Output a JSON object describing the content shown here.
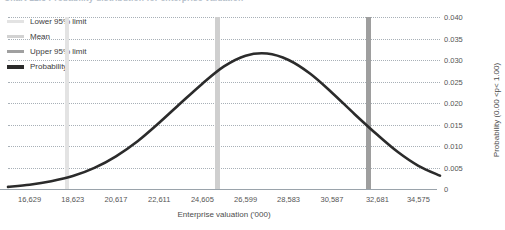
{
  "chart_title": "Chart 12.3  Probability distribution for enterprise valuation",
  "legend": {
    "items": [
      {
        "label": "Lower 95% limit",
        "color": "#e3e3e3",
        "thick": false
      },
      {
        "label": "Mean",
        "color": "#d2d2d2",
        "thick": false
      },
      {
        "label": "Upper 95% limit",
        "color": "#a0a0a0",
        "thick": false
      },
      {
        "label": "Probability",
        "color": "#2b2b2b",
        "thick": true
      }
    ]
  },
  "chart_data": {
    "type": "line",
    "title": "Chart 12.3  Probability distribution for enterprise valuation",
    "xlabel": "Enterprise valuation ('000)",
    "ylabel": "Probability (0.00 <p< 1.00)",
    "xlim": [
      15632,
      35572
    ],
    "ylim": [
      0,
      0.04
    ],
    "grid": true,
    "legend_position": "top-left",
    "x_tick_labels": [
      "16,629",
      "18,623",
      "20,617",
      "22,611",
      "24,605",
      "26,599",
      "28,583",
      "30,587",
      "32,681",
      "34,575"
    ],
    "x_tick_values": [
      16629,
      18623,
      20617,
      22611,
      24605,
      26599,
      28583,
      30587,
      32681,
      34575
    ],
    "y_tick_labels": [
      "0",
      "0.005",
      "0.010",
      "0.015",
      "0.020",
      "0.025",
      "0.030",
      "0.035",
      "0.040"
    ],
    "y_tick_values": [
      0,
      0.005,
      0.01,
      0.015,
      0.02,
      0.025,
      0.03,
      0.035,
      0.04
    ],
    "series": [
      {
        "name": "Probability",
        "color": "#2b2b2b",
        "type": "line",
        "x": [
          15632,
          16629,
          17626,
          18623,
          19620,
          20617,
          21614,
          22611,
          23608,
          24605,
          25602,
          26599,
          27591,
          28583,
          29585,
          30587,
          31634,
          32681,
          33628,
          34575,
          35572
        ],
        "y": [
          0.0005,
          0.001,
          0.0018,
          0.003,
          0.0049,
          0.0076,
          0.0111,
          0.0154,
          0.02,
          0.0245,
          0.0285,
          0.031,
          0.0315,
          0.03,
          0.0268,
          0.0224,
          0.0174,
          0.0126,
          0.0086,
          0.0054,
          0.0031
        ]
      }
    ],
    "reference_lines": [
      {
        "name": "Lower 95% limit",
        "x": 18350,
        "color": "#e3e3e3",
        "orientation": "vertical"
      },
      {
        "name": "Mean",
        "x": 25320,
        "color": "#cfcfcf",
        "orientation": "vertical"
      },
      {
        "name": "Upper 95% limit",
        "x": 32250,
        "color": "#9e9e9e",
        "orientation": "vertical"
      }
    ]
  }
}
